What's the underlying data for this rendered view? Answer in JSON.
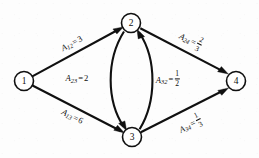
{
  "figure": {
    "type": "directed-graph",
    "background_color": "#fdfdfd",
    "ink_color": "#101010",
    "width": 259,
    "height": 158
  },
  "nodes": [
    {
      "id": "1",
      "label": "1",
      "cx": 24,
      "cy": 81,
      "r": 9.5
    },
    {
      "id": "2",
      "label": "2",
      "cx": 131,
      "cy": 23,
      "r": 9.5
    },
    {
      "id": "3",
      "label": "3",
      "cx": 132,
      "cy": 137,
      "r": 9.5
    },
    {
      "id": "4",
      "label": "4",
      "cx": 236,
      "cy": 81,
      "r": 9.5
    }
  ],
  "edges": [
    {
      "id": "e12",
      "from": "1",
      "to": "2",
      "shape": "straight",
      "label": {
        "symbol": "A",
        "subscript": "12",
        "relation": "=",
        "value": "3",
        "value_type": "integer"
      },
      "label_position": {
        "x": 72,
        "y": 44,
        "rotation": -28
      }
    },
    {
      "id": "e13",
      "from": "1",
      "to": "3",
      "shape": "straight",
      "label": {
        "symbol": "A",
        "subscript": "13",
        "relation": "=",
        "value": "6",
        "value_type": "integer"
      },
      "label_position": {
        "x": 72,
        "y": 117,
        "rotation": 27
      }
    },
    {
      "id": "e23",
      "from": "2",
      "to": "3",
      "shape": "curve-left",
      "label": {
        "symbol": "A",
        "subscript": "23",
        "relation": "=",
        "value": "2",
        "value_type": "integer"
      },
      "label_position": {
        "x": 77,
        "y": 79,
        "rotation": 0
      }
    },
    {
      "id": "e32",
      "from": "3",
      "to": "2",
      "shape": "curve-right",
      "label": {
        "symbol": "A",
        "subscript": "32",
        "relation": "=",
        "numerator": "1",
        "denominator": "2",
        "value_type": "fraction"
      },
      "label_position": {
        "x": 168,
        "y": 79,
        "rotation": 0
      }
    },
    {
      "id": "e24",
      "from": "2",
      "to": "4",
      "shape": "straight",
      "label": {
        "symbol": "A",
        "subscript": "24",
        "relation": "=",
        "numerator": "2",
        "denominator": "3",
        "value_type": "fraction"
      },
      "label_position": {
        "x": 191,
        "y": 40,
        "rotation": 27
      }
    },
    {
      "id": "e34",
      "from": "3",
      "to": "4",
      "shape": "straight",
      "label": {
        "symbol": "A",
        "subscript": "34",
        "relation": "=",
        "numerator": "1",
        "denominator": "3",
        "value_type": "fraction"
      },
      "label_position": {
        "x": 190,
        "y": 124,
        "rotation": -27
      }
    }
  ]
}
